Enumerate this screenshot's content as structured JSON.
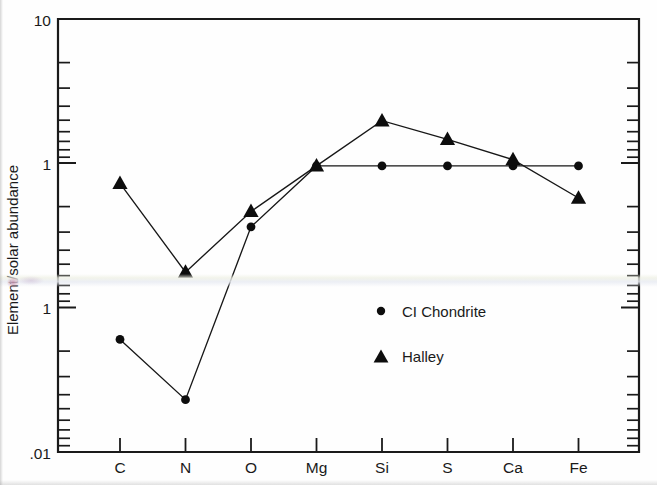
{
  "chart_data": {
    "type": "line",
    "title": "",
    "subtitle": "",
    "xlabel": "",
    "ylabel": "Element/solar abundance",
    "categories": [
      "C",
      "N",
      "O",
      "Mg",
      "Si",
      "S",
      "Ca",
      "Fe"
    ],
    "yscale": "log",
    "ylim": [
      0.01,
      10
    ],
    "ytick_labels": [
      "10",
      "1",
      "1",
      ".01"
    ],
    "ytick_values": [
      10,
      1,
      0.1,
      0.01
    ],
    "grid": false,
    "legend_position": "center",
    "series": [
      {
        "name": "CI Chondrite",
        "marker": "circle",
        "values": [
          0.06,
          0.023,
          0.36,
          0.95,
          0.95,
          0.95,
          0.95,
          0.95
        ]
      },
      {
        "name": "Halley",
        "marker": "triangle",
        "values": [
          0.72,
          0.175,
          0.46,
          0.95,
          1.95,
          1.45,
          1.05,
          0.57
        ]
      }
    ]
  },
  "axes": {
    "y_axis_title": "Element/solar abundance",
    "y_labels": [
      {
        "text": "10",
        "value": 10
      },
      {
        "text": "1",
        "value": 1
      },
      {
        "text": "1",
        "value": 0.1
      },
      {
        "text": ".01",
        "value": 0.01
      }
    ],
    "x_labels": [
      "C",
      "N",
      "O",
      "Mg",
      "Si",
      "S",
      "Ca",
      "Fe"
    ]
  },
  "legend": {
    "entries": [
      {
        "label": "CI Chondrite",
        "marker": "circle"
      },
      {
        "label": "Halley",
        "marker": "triangle"
      }
    ]
  },
  "colors": {
    "ink": "#1a1a1a",
    "marker": "#0d0d0d",
    "background": "#fefefe"
  }
}
